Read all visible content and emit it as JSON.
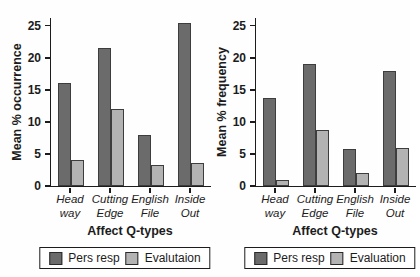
{
  "colors": {
    "bar_dark": "#6b6b6b",
    "bar_light": "#b3b3b3",
    "bar_border": "#3d3d3d",
    "axis": "#1c1c1c",
    "background": "#fefefe",
    "legend_border": "#1c1c1c"
  },
  "chart_data": [
    {
      "type": "bar",
      "title": "",
      "ylabel": "Mean % occurrence",
      "xlabel": "Affect Q-types",
      "categories": [
        [
          "Head",
          "way"
        ],
        [
          "Cutting",
          "Edge"
        ],
        [
          "English",
          "File"
        ],
        [
          "Inside",
          "Out"
        ]
      ],
      "yticks": [
        0,
        5,
        10,
        15,
        20,
        25
      ],
      "ylim": [
        0,
        26.2
      ],
      "grid": false,
      "legend_position": "bottom",
      "series": [
        {
          "name": "Pers resp",
          "color": "#6b6b6b",
          "values": [
            16,
            21.5,
            8,
            25.5
          ]
        },
        {
          "name": "Evalutaion",
          "color": "#b3b3b3",
          "values": [
            4,
            12,
            3.3,
            3.6
          ]
        }
      ]
    },
    {
      "type": "bar",
      "title": "",
      "ylabel": "Mean % frequency",
      "xlabel": "Affect Q-types",
      "categories": [
        [
          "Head",
          "way"
        ],
        [
          "Cutting",
          "Edge"
        ],
        [
          "English",
          "File"
        ],
        [
          "Inside",
          "Out"
        ]
      ],
      "yticks": [
        0,
        5,
        10,
        15,
        20,
        25
      ],
      "ylim": [
        0,
        26.2
      ],
      "grid": false,
      "legend_position": "bottom",
      "series": [
        {
          "name": "Pers resp",
          "color": "#6b6b6b",
          "values": [
            13.7,
            19,
            5.8,
            18
          ]
        },
        {
          "name": "Evaluation",
          "color": "#b3b3b3",
          "values": [
            1,
            8.8,
            2,
            6
          ]
        }
      ]
    }
  ]
}
